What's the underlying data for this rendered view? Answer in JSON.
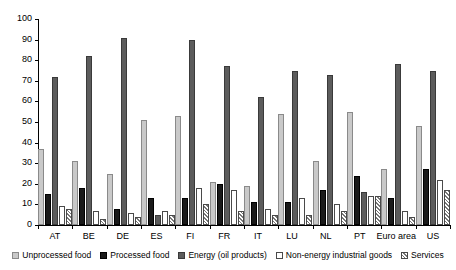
{
  "chart_data": {
    "type": "bar",
    "title": "",
    "subtitle": "",
    "xlabel": "",
    "ylabel": "",
    "ylim": [
      0,
      100
    ],
    "ytick_values": [
      0,
      10,
      20,
      30,
      40,
      50,
      60,
      70,
      80,
      90,
      100
    ],
    "ytick_labels": [
      "0",
      "10",
      "20",
      "30",
      "40",
      "50",
      "60",
      "70",
      "80",
      "90",
      "100"
    ],
    "grid": false,
    "legend_position": "bottom",
    "categories": [
      "AT",
      "BE",
      "DE",
      "ES",
      "FI",
      "FR",
      "IT",
      "LU",
      "NL",
      "PT",
      "Euro area",
      "US"
    ],
    "series": [
      {
        "name": "Unprocessed food",
        "color": "#c9c9c9",
        "pattern": "solid-light-gray",
        "values": [
          37,
          31,
          25,
          51,
          53,
          21,
          19,
          54,
          31,
          55,
          27,
          48
        ]
      },
      {
        "name": "Processed food",
        "color": "#1a1a1a",
        "pattern": "solid-black",
        "values": [
          15,
          18,
          8,
          13,
          13,
          20,
          11,
          11,
          17,
          24,
          13,
          27
        ]
      },
      {
        "name": "Energy (oil products)",
        "color": "#5c5c5c",
        "pattern": "solid-dark-gray",
        "values": [
          72,
          82,
          91,
          5,
          90,
          77,
          62,
          75,
          73,
          16,
          78,
          75
        ]
      },
      {
        "name": "Non-energy industrial goods",
        "color": "#ffffff",
        "pattern": "open-white",
        "values": [
          9,
          7,
          6,
          7,
          18,
          17,
          8,
          13,
          10,
          14,
          7,
          22
        ]
      },
      {
        "name": "Services",
        "color": "#ffffff",
        "pattern": "diagonal-hatch",
        "values": [
          8,
          3,
          4,
          5,
          10,
          7,
          5,
          5,
          7,
          14,
          4,
          17
        ]
      }
    ]
  }
}
